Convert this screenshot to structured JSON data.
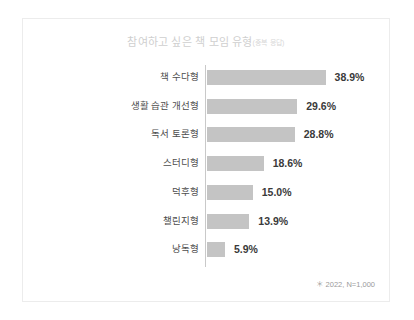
{
  "card": {
    "title_main": "참여하고 싶은 책 모임 유형",
    "title_note": "(중복 응답)",
    "footnote": "＊ 2022, N=1,000"
  },
  "chart_data": {
    "type": "bar",
    "orientation": "horizontal",
    "xlabel": "",
    "ylabel": "",
    "xlim": [
      0,
      42
    ],
    "grid": false,
    "legend": false,
    "unit": "%",
    "note": "＊ 2022, N=1,000",
    "categories": [
      "책 수다형",
      "생활 습관 개선형",
      "독서 토론형",
      "스터디형",
      "덕후형",
      "챌린지형",
      "낭독형"
    ],
    "values": [
      38.9,
      29.6,
      28.8,
      18.6,
      15.0,
      13.9,
      5.9
    ],
    "value_labels": [
      "38.9%",
      "29.6%",
      "28.8%",
      "18.6%",
      "15.0%",
      "13.9%",
      "5.9%"
    ],
    "bar_color": "#c4c4c4",
    "axis_color": "#c9c9c9",
    "label_color": "#4d4d4d",
    "value_color": "#3a3a3a"
  }
}
